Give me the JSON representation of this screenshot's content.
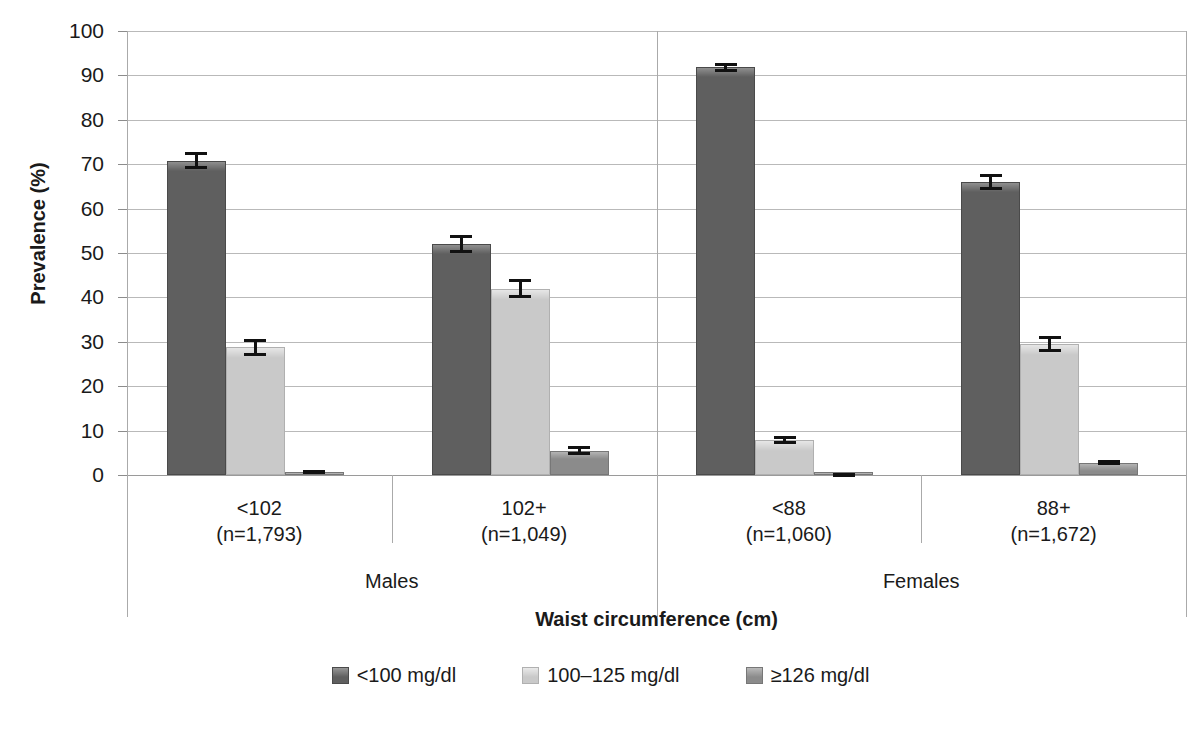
{
  "chart_data": {
    "type": "bar",
    "title": "",
    "xlabel": "Waist circumference (cm)",
    "ylabel": "Prevalence (%)",
    "ylim": [
      0,
      100
    ],
    "yticks": [
      0,
      10,
      20,
      30,
      40,
      50,
      60,
      70,
      80,
      90,
      100
    ],
    "ytick_labels": [
      "0",
      "10",
      "20",
      "30",
      "40",
      "50",
      "60",
      "70",
      "80",
      "90",
      "100"
    ],
    "grid": true,
    "legend_position": "bottom",
    "categories": [
      "<102\n(n=1,793)",
      "102+\n(n=1,049)",
      "<88\n(n=1,060)",
      "88+\n(n=1,672)"
    ],
    "category_lines": [
      [
        "<102",
        "(n=1,793)"
      ],
      [
        "102+",
        "(n=1,049)"
      ],
      [
        "<88",
        "(n=1,060)"
      ],
      [
        "88+",
        "(n=1,672)"
      ]
    ],
    "supergroups": [
      {
        "label": "Males",
        "categories": [
          0,
          1
        ]
      },
      {
        "label": "Females",
        "categories": [
          2,
          3
        ]
      }
    ],
    "series": [
      {
        "name": "<100 mg/dl",
        "color": "#5f5f5f",
        "values": [
          70.8,
          52.0,
          91.8,
          66.0
        ],
        "errors": [
          1.9,
          2.0,
          1.0,
          1.9
        ]
      },
      {
        "name": "100–125 mg/dl",
        "color": "#c9c9c9",
        "values": [
          28.8,
          42.0,
          7.8,
          29.5
        ],
        "errors": [
          1.9,
          2.1,
          0.9,
          1.9
        ]
      },
      {
        "name": "≥126 mg/dl",
        "color": "#8b8b8b",
        "values": [
          0.7,
          5.5,
          0.2,
          2.8
        ],
        "errors": [
          0.4,
          1.1,
          0.15,
          0.5
        ]
      }
    ]
  },
  "colors": {
    "series_dark": "#5f5f5f",
    "series_light": "#c9c9c9",
    "series_mid": "#8b8b8b",
    "gridline": "#b9b9b9",
    "axis": "#9a9a9a",
    "text": "#1a1a1a",
    "background": "#ffffff"
  },
  "legend": {
    "items": [
      {
        "label": "<100 mg/dl",
        "swatch": "series-dark-swatch"
      },
      {
        "label": "100–125 mg/dl",
        "swatch": "series-light-swatch"
      },
      {
        "label": "≥126 mg/dl",
        "swatch": "series-mid-swatch"
      }
    ]
  }
}
